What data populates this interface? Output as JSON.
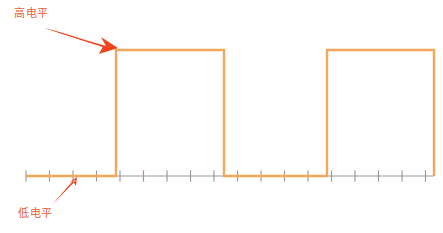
{
  "figure": {
    "type": "digital-waveform-diagram",
    "background_color": "#ffffff",
    "signal_color": "#f0a85c",
    "axis_color": "#9a9a9a",
    "annotation_color": "#f0441f",
    "label_color": "#e8603a"
  },
  "annotations": {
    "high_level": {
      "text": "高电平",
      "icon": "arrow-down-right-icon",
      "points_to": "pulse-top-edge"
    },
    "low_level": {
      "text": "低电平",
      "icon": "arrow-up-right-icon",
      "points_to": "baseline"
    }
  },
  "chart_data": {
    "type": "line",
    "title": "",
    "xlabel": "",
    "ylabel": "",
    "xlim": [
      0,
      443
    ],
    "ylim": [
      0,
      233
    ],
    "grid": false,
    "legend": null,
    "series": [
      {
        "name": "digital-signal",
        "color": "#f0a85c",
        "levels": {
          "low": 176,
          "high": 50
        },
        "points": [
          [
            26,
            176
          ],
          [
            116,
            176
          ],
          [
            116,
            50
          ],
          [
            224,
            50
          ],
          [
            224,
            176
          ],
          [
            327,
            176
          ],
          [
            327,
            50
          ],
          [
            434,
            50
          ],
          [
            434,
            176
          ]
        ]
      }
    ],
    "axis": {
      "baseline_y": 176,
      "x_start": 26,
      "x_end": 434,
      "tick_spacing": 23.5,
      "tick_count": 18,
      "tick_height": 11,
      "tick_color": "#9a9a9a"
    }
  }
}
